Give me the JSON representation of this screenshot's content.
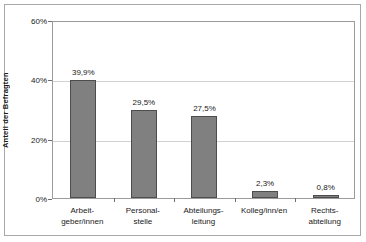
{
  "chart_data": {
    "type": "bar",
    "title": "",
    "subtitle": "",
    "xlabel": "",
    "ylabel": "Anteil der Befragten",
    "ylim": [
      0,
      60
    ],
    "yticks": [
      "0%",
      "20%",
      "40%",
      "60%"
    ],
    "ytick_values": [
      0,
      20,
      40,
      60
    ],
    "grid": true,
    "legend": null,
    "categories": [
      "Arbeit-\ngeber/innen",
      "Personal-\nstelle",
      "Abteilungs-\nleitung",
      "Kolleg/inn/en",
      "Rechts-\nabteilung"
    ],
    "category_lines": [
      [
        "Arbeit-",
        "geber/innen"
      ],
      [
        "Personal-",
        "stelle"
      ],
      [
        "Abteilungs-",
        "leitung"
      ],
      [
        "Kolleg/inn/en",
        ""
      ],
      [
        "Rechts-",
        "abteilung"
      ]
    ],
    "values": [
      39.9,
      29.5,
      27.5,
      2.3,
      0.8
    ],
    "value_labels": [
      "39,9%",
      "29,5%",
      "27,5%",
      "2,3%",
      "0,8%"
    ],
    "colors": {
      "bar_fill": "#808080",
      "bar_border": "#4d4d4d",
      "gridline": "#d2d2d2",
      "axis": "#9b9b9b",
      "text": "#1a1a1a",
      "background": "#ffffff",
      "frame": "#a8a8a8"
    }
  }
}
